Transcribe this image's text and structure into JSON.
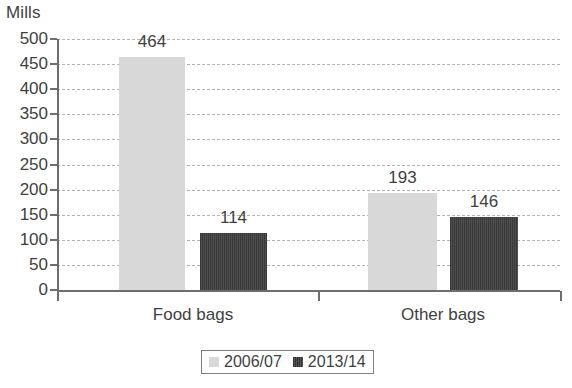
{
  "chart_data": {
    "type": "bar",
    "title": "",
    "subtitle": "",
    "xlabel": "",
    "ylabel": "Mills",
    "ylim": [
      0,
      500
    ],
    "ytick_step": 50,
    "grid": true,
    "legend_position": "bottom",
    "categories": [
      "Food bags",
      "Other bags"
    ],
    "series": [
      {
        "name": "2006/07",
        "color": "#d8d8d8",
        "values": [
          464,
          193
        ]
      },
      {
        "name": "2013/14",
        "color": "#444444",
        "values": [
          114,
          146
        ]
      }
    ],
    "y_ticks": [
      "500",
      "450",
      "400",
      "350",
      "300",
      "250",
      "200",
      "150",
      "100",
      "50",
      "0"
    ],
    "data_labels": [
      "464",
      "114",
      "193",
      "146"
    ]
  },
  "axis": {
    "unit_label": "Mills"
  },
  "legend": {
    "items": [
      {
        "label": "2006/07"
      },
      {
        "label": "2013/14"
      }
    ]
  }
}
